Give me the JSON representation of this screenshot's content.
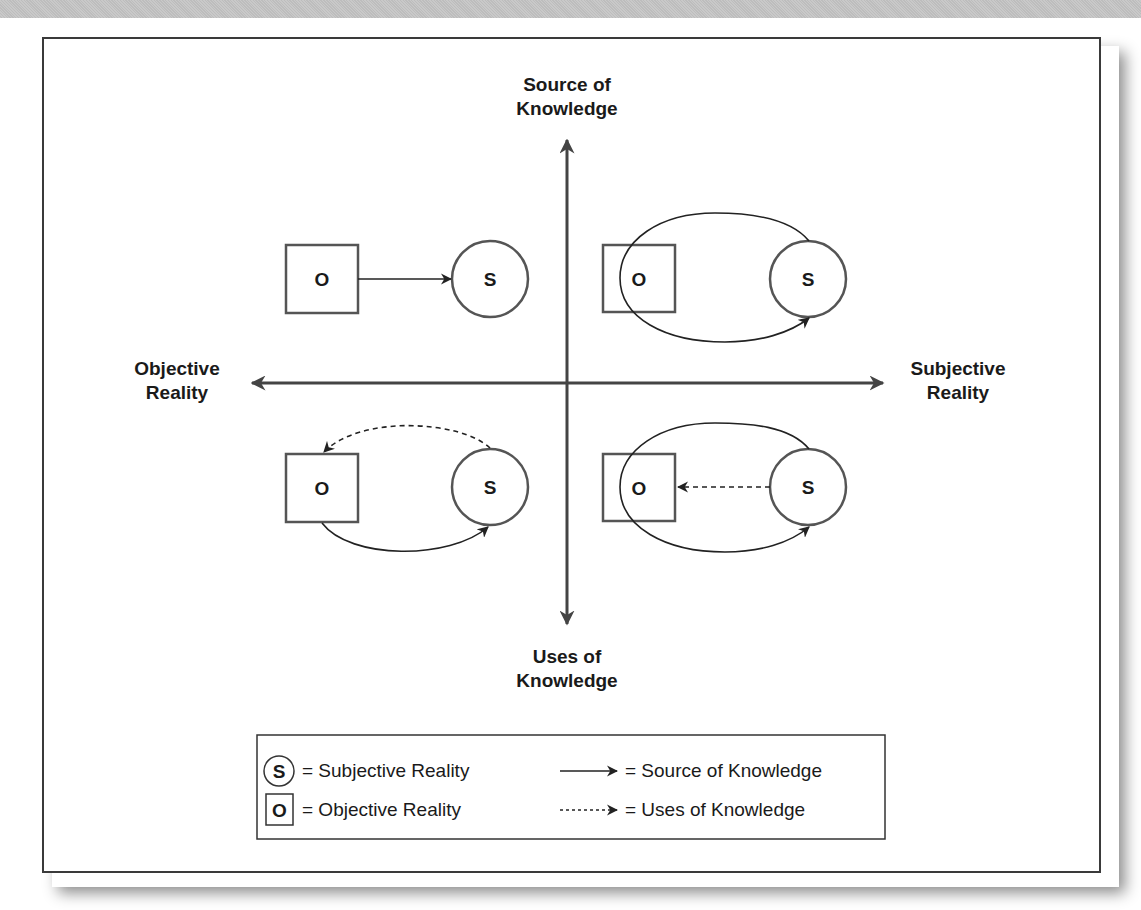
{
  "diagram": {
    "axes": {
      "top": {
        "line1": "Source of",
        "line2": "Knowledge"
      },
      "bottom": {
        "line1": "Uses of",
        "line2": "Knowledge"
      },
      "left": {
        "line1": "Objective",
        "line2": "Reality"
      },
      "right": {
        "line1": "Subjective",
        "line2": "Reality"
      }
    },
    "quadrants": [
      {
        "position": "top-left",
        "objective_label": "O",
        "subjective_label": "S",
        "relations": [
          "O → S (source, solid)"
        ]
      },
      {
        "position": "top-right",
        "objective_label": "O",
        "subjective_label": "S",
        "relations": [
          "O ↔ S ellipse loop, solid arrow to S"
        ]
      },
      {
        "position": "bottom-left",
        "objective_label": "O",
        "subjective_label": "S",
        "relations": [
          "S → O (uses, dashed arc)",
          "O → S (source, solid arc)"
        ]
      },
      {
        "position": "bottom-right",
        "objective_label": "O",
        "subjective_label": "S",
        "relations": [
          "S → O (uses, dashed)",
          "O ↔ S ellipse loop, solid arrow to S"
        ]
      }
    ],
    "legend": {
      "s_symbol": "S",
      "s_text": "= Subjective Reality",
      "o_symbol": "O",
      "o_text": "= Objective Reality",
      "solid_text": "= Source of Knowledge",
      "dashed_text": "= Uses of Knowledge"
    }
  }
}
